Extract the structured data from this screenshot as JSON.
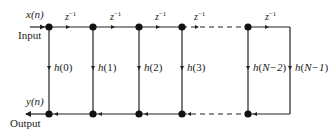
{
  "diagram": {
    "input": {
      "signal": "x(n)",
      "label": "Input"
    },
    "output": {
      "signal": "y(n)",
      "label": "Output"
    },
    "delay_label": "z",
    "delay_exponent": "−1",
    "taps": [
      {
        "coef_name": "h",
        "index": "0"
      },
      {
        "coef_name": "h",
        "index": "1"
      },
      {
        "coef_name": "h",
        "index": "2"
      },
      {
        "coef_name": "h",
        "index": "3"
      },
      {
        "coef_name": "h",
        "index": "N−2"
      },
      {
        "coef_name": "h",
        "index": "N−1"
      }
    ],
    "colors": {
      "line": "#222222",
      "node": "#111111",
      "background": "#ffffff"
    }
  }
}
